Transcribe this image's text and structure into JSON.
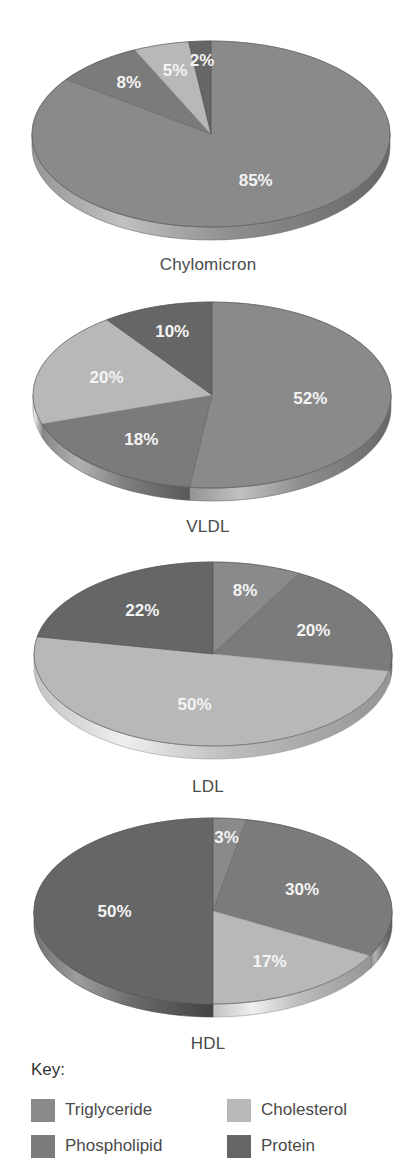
{
  "key": {
    "title": "Key:",
    "items": [
      {
        "name": "Triglyceride",
        "color": "#8a8a8a"
      },
      {
        "name": "Cholesterol",
        "color": "#b8b8b8"
      },
      {
        "name": "Phospholipid",
        "color": "#7b7b7b"
      },
      {
        "name": "Protein",
        "color": "#666666"
      }
    ]
  },
  "chart_data": [
    {
      "type": "pie",
      "title": "Chylomicron",
      "categories": [
        "Triglyceride",
        "Phospholipid",
        "Cholesterol",
        "Protein"
      ],
      "values": [
        85,
        8,
        5,
        2
      ],
      "labels": [
        "85%",
        "8%",
        "5%",
        "2%"
      ],
      "start_angle": "12 o'clock",
      "direction": "clockwise",
      "style": "3d-tilted"
    },
    {
      "type": "pie",
      "title": "VLDL",
      "categories": [
        "Triglyceride",
        "Phospholipid",
        "Cholesterol",
        "Protein"
      ],
      "values": [
        52,
        18,
        20,
        10
      ],
      "labels": [
        "52%",
        "18%",
        "20%",
        "10%"
      ],
      "start_angle": "12 o'clock",
      "direction": "clockwise",
      "style": "3d-tilted"
    },
    {
      "type": "pie",
      "title": "LDL",
      "categories": [
        "Triglyceride",
        "Phospholipid",
        "Cholesterol",
        "Protein"
      ],
      "values": [
        8,
        20,
        50,
        22
      ],
      "labels": [
        "8%",
        "20%",
        "50%",
        "22%"
      ],
      "start_angle": "12 o'clock",
      "direction": "clockwise",
      "style": "3d-tilted"
    },
    {
      "type": "pie",
      "title": "HDL",
      "categories": [
        "Triglyceride",
        "Phospholipid",
        "Cholesterol",
        "Protein"
      ],
      "values": [
        3,
        30,
        17,
        50
      ],
      "labels": [
        "3%",
        "30%",
        "17%",
        "50%"
      ],
      "start_angle": "12 o'clock",
      "direction": "clockwise",
      "style": "3d-tilted"
    }
  ],
  "colors": {
    "Triglyceride": "#8a8a8a",
    "Phospholipid": "#7b7b7b",
    "Cholesterol": "#b8b8b8",
    "Protein": "#666666"
  }
}
